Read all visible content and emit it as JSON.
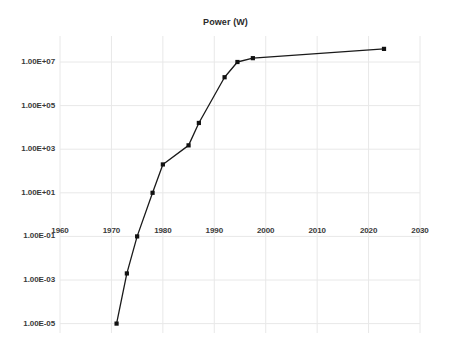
{
  "chart_data": {
    "type": "line",
    "title": "Power (W)",
    "xlabel": "",
    "ylabel": "",
    "yscale": "log",
    "grid": true,
    "legend": "none",
    "xlim": [
      1960,
      2030
    ],
    "ylim": [
      1e-05,
      100000000.0
    ],
    "xticks": [
      1960,
      1970,
      1980,
      1990,
      2000,
      2010,
      2020,
      2030
    ],
    "xtick_labels": [
      "1960",
      "1970",
      "1980",
      "1990",
      "2000",
      "2010",
      "2020",
      "2030"
    ],
    "yticks": [
      10000000.0,
      100000.0,
      1000.0,
      10.0,
      0.1,
      0.001,
      1e-05
    ],
    "ytick_labels": [
      "1.00E+07",
      "1.00E+05",
      "1.00E+03",
      "1.00E+01",
      "1.00E-01",
      "1.00E-03",
      "1.00E-05"
    ],
    "series": [
      {
        "name": "Power (W)",
        "color": "#1a1a1a",
        "marker": "square",
        "x": [
          1971,
          1973,
          1975,
          1978,
          1980,
          1985,
          1987,
          1992,
          1994.5,
          1997.5,
          2023
        ],
        "y": [
          1e-05,
          0.002,
          0.1,
          10.0,
          200.0,
          1500.0,
          16000.0,
          2000000.0,
          10000000.0,
          15000000.0,
          40000000.0
        ]
      }
    ]
  },
  "colors": {
    "line": "#1a1a1a",
    "marker": "#111111",
    "grid": "#e8e8e8",
    "text": "#3a3a3a",
    "background": "#ffffff"
  }
}
